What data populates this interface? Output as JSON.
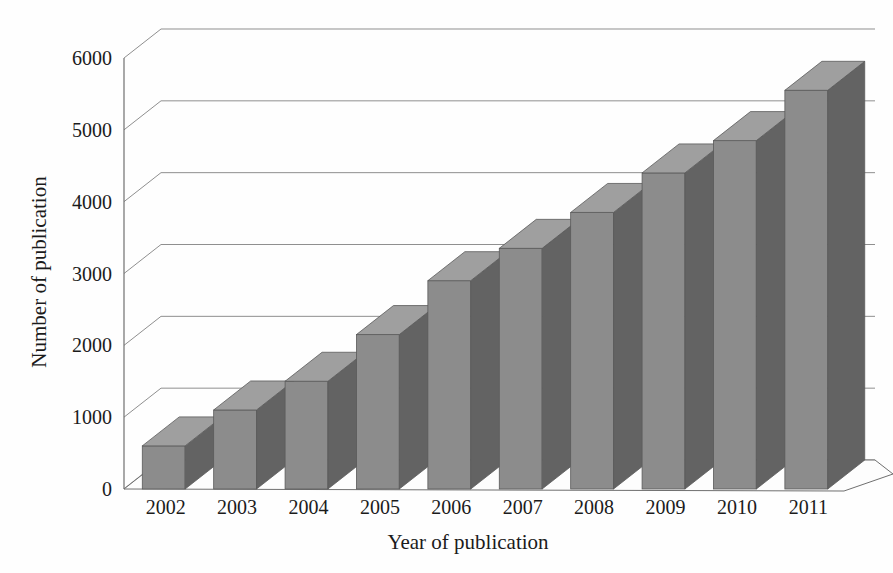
{
  "chart_data": {
    "type": "bar",
    "style": "3d-column",
    "title": "",
    "subtitle": "",
    "xlabel": "Year of publication",
    "ylabel": "Number of publication",
    "categories": [
      "2002",
      "2003",
      "2004",
      "2005",
      "2006",
      "2007",
      "2008",
      "2009",
      "2010",
      "2011"
    ],
    "values": [
      600,
      1100,
      1500,
      2150,
      2900,
      3350,
      3850,
      4400,
      4850,
      5550
    ],
    "series": [
      {
        "name": "Number of publication",
        "values": [
          600,
          1100,
          1500,
          2150,
          2900,
          3350,
          3850,
          4400,
          4850,
          5550
        ]
      }
    ],
    "ylim": [
      0,
      6000
    ],
    "ytick_labels": [
      "0",
      "1000",
      "2000",
      "3000",
      "4000",
      "5000",
      "6000"
    ],
    "ytick_values": [
      0,
      1000,
      2000,
      3000,
      4000,
      5000,
      6000
    ],
    "xtick_labels": [
      "2002",
      "2003",
      "2004",
      "2005",
      "2006",
      "2007",
      "2008",
      "2009",
      "2010",
      "2011"
    ],
    "grid": true,
    "grid_axis": "y",
    "legend": false,
    "legend_position": "none",
    "annotations": [],
    "colors": {
      "bar_front": "#8c8c8c",
      "bar_side": "#636363",
      "bar_top": "#9f9f9f",
      "bar_outline": "#5a5a5a",
      "gridline": "#8f8f8f",
      "axis_line": "#6f6f6f",
      "floor": "#fdfdfd",
      "background": "#fefefe",
      "text": "#1b1b1b"
    }
  }
}
